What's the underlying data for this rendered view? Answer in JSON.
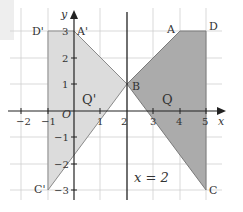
{
  "diagram": {
    "axes": {
      "x_label": "x",
      "y_label": "y",
      "origin_label": "O",
      "x_ticks": [
        "−2",
        "−1",
        "1",
        "2",
        "3",
        "4",
        "5"
      ],
      "x_tick_values": [
        -2,
        -1,
        1,
        2,
        3,
        4,
        5
      ],
      "y_ticks": [
        "3",
        "2",
        "1",
        "−1",
        "−2",
        "−3"
      ],
      "y_tick_values": [
        3,
        2,
        1,
        -1,
        -2,
        -3
      ]
    },
    "mirror_line": {
      "label": "x = 2",
      "x": 2
    },
    "shape_Q": {
      "label": "Q",
      "fill": "#a9a9a9",
      "vertices": [
        {
          "name": "A",
          "x": 4,
          "y": 3
        },
        {
          "name": "D",
          "x": 5,
          "y": 3
        },
        {
          "name": "C",
          "x": 5,
          "y": -3
        },
        {
          "name": "B",
          "x": 2,
          "y": 1
        }
      ]
    },
    "shape_Q_prime": {
      "label": "Q'",
      "fill": "#dcdcdc",
      "vertices": [
        {
          "name": "A'",
          "x": 0,
          "y": 3
        },
        {
          "name": "D'",
          "x": -1,
          "y": 3
        },
        {
          "name": "C'",
          "x": -1,
          "y": -3
        },
        {
          "name": "B",
          "x": 2,
          "y": 1
        }
      ]
    },
    "point_labels": {
      "A": "A",
      "D": "D",
      "C": "C",
      "B": "B",
      "A_prime": "A'",
      "D_prime": "D'",
      "C_prime": "C'"
    },
    "colors": {
      "grid": "#c8c8c8",
      "axis": "#222222",
      "edge": "#7a7a7a"
    }
  }
}
